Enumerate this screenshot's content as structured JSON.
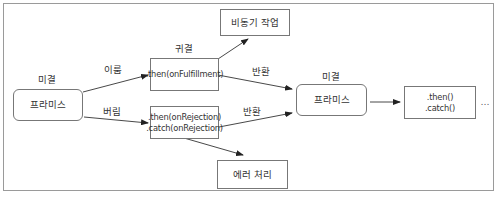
{
  "diagram": {
    "nodes": {
      "promise_initial": {
        "label": "프라미스",
        "state_label": "미결"
      },
      "then_fulfilled": {
        "lines": [
          ".then(onFulfillment)"
        ],
        "state_label": "귀결"
      },
      "then_rejected": {
        "lines": [
          ".then(onRejection)",
          ".catch(onRejection)"
        ]
      },
      "async_task": {
        "label": "비동기 작업"
      },
      "error_handling": {
        "label": "에러 처리"
      },
      "promise_returned": {
        "label": "프라미스",
        "state_label": "미결"
      },
      "next_chain": {
        "lines": [
          ".then()",
          ".catch()"
        ]
      },
      "ellipsis": "..."
    },
    "edges": [
      {
        "from": "promise_initial",
        "to": "then_fulfilled",
        "label": "이룸"
      },
      {
        "from": "promise_initial",
        "to": "then_rejected",
        "label": "버림"
      },
      {
        "from": "then_fulfilled",
        "to": "async_task",
        "label": ""
      },
      {
        "from": "then_fulfilled",
        "to": "promise_returned",
        "label": "반환"
      },
      {
        "from": "then_rejected",
        "to": "promise_returned",
        "label": "반환"
      },
      {
        "from": "then_rejected",
        "to": "error_handling",
        "label": ""
      },
      {
        "from": "promise_returned",
        "to": "next_chain",
        "label": ""
      }
    ],
    "colors": {
      "line": "#333333",
      "border": "#777777",
      "frame": "#9a9a9a",
      "text": "#333333"
    }
  }
}
